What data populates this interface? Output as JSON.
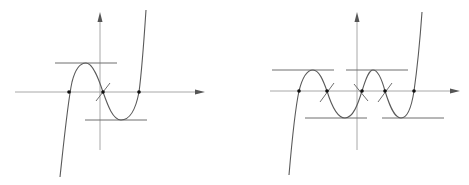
{
  "figure": {
    "colors": {
      "axis": "#a8a8a8",
      "curve": "#5a5a5a",
      "tangent": "#6e6e6e",
      "point": "#111111",
      "background": "#ffffff"
    },
    "panels": [
      {
        "id": "left",
        "kind": "cubic",
        "x_axis": {
          "x1": 15,
          "x2": 205,
          "y": 92
        },
        "y_axis": {
          "x": 100,
          "y1": 150,
          "y2": 12
        },
        "curve_path": "M 60 177 C 64 140, 68 100, 72 82 C 76 66, 82 63, 86 63 C 93 63, 99 80, 103 92 C 108 106, 113 120, 121 120 C 130 120, 136 108, 139 92 C 142 70, 144 40, 146 10",
        "extremum_tangents": [
          {
            "x1": 55,
            "x2": 117,
            "y": 63
          },
          {
            "x1": 85,
            "x2": 147,
            "y": 120
          }
        ],
        "inflection_tangents": [
          {
            "x1": 96,
            "y1": 101,
            "x2": 110,
            "y2": 83
          }
        ],
        "roots": [
          {
            "x": 69,
            "y": 92
          },
          {
            "x": 103,
            "y": 92
          },
          {
            "x": 139,
            "y": 92
          }
        ]
      },
      {
        "id": "right",
        "kind": "quintic",
        "x_axis": {
          "x1": 270,
          "x2": 460,
          "y": 91
        },
        "y_axis": {
          "x": 357,
          "y1": 150,
          "y2": 12
        },
        "curve_path": "M 289 175 C 292 140, 296 105, 299 91 C 303 75, 308 70, 313 70 C 319 70, 323 80, 327 91 C 331 104, 337 118, 345 118 C 353 118, 358 104, 362 91 C 366 78, 369 70, 373 70 C 378 70, 382 80, 385 91 C 389 104, 394 118, 401 118 C 408 118, 412 104, 414 91 C 417 70, 420 40, 422 12",
        "extremum_tangents": [
          {
            "x1": 272,
            "x2": 334,
            "y": 70
          },
          {
            "x1": 346,
            "x2": 408,
            "y": 70
          },
          {
            "x1": 305,
            "x2": 367,
            "y": 118
          },
          {
            "x1": 382,
            "x2": 444,
            "y": 118
          }
        ],
        "inflection_tangents": [
          {
            "x1": 320,
            "y1": 102,
            "x2": 334,
            "y2": 83
          },
          {
            "x1": 354,
            "y1": 84,
            "x2": 368,
            "y2": 101
          },
          {
            "x1": 378,
            "y1": 102,
            "x2": 392,
            "y2": 83
          }
        ],
        "roots": [
          {
            "x": 299,
            "y": 91
          },
          {
            "x": 327,
            "y": 91
          },
          {
            "x": 362,
            "y": 91
          },
          {
            "x": 385,
            "y": 91
          },
          {
            "x": 414,
            "y": 91
          }
        ]
      }
    ]
  }
}
